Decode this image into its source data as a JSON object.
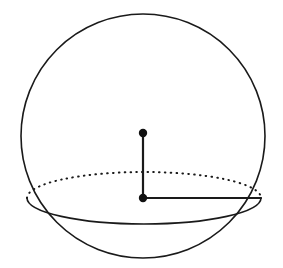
{
  "figure": {
    "background_color": "#ffffff",
    "stroke_color": "#1a1a1a",
    "dot_color": "#111111",
    "width": 283,
    "height": 268
  },
  "chart_data": {
    "type": "diagram",
    "subtype": "solid-geometry-sphere",
    "xlabel": "",
    "ylabel": "",
    "grid": false,
    "legend": false,
    "annotations": [],
    "shapes": [
      {
        "name": "sphere-outline",
        "kind": "circle",
        "cx": 143,
        "cy": 136,
        "r": 122,
        "style": "solid",
        "stroke_width": 1.6,
        "fill": "none"
      },
      {
        "name": "cross-section-back-arc",
        "kind": "ellipse-arc",
        "cx": 144,
        "cy": 198,
        "rx": 117,
        "ry": 26,
        "arc_half": "back-upper",
        "style": "dotted",
        "stroke_width": 2.0,
        "dash_pattern": "0.6 5.2"
      },
      {
        "name": "cross-section-front-arc",
        "kind": "ellipse-arc",
        "cx": 144,
        "cy": 198,
        "rx": 117,
        "ry": 26,
        "arc_half": "front-lower",
        "style": "solid",
        "stroke_width": 1.6
      },
      {
        "name": "vertical-axis-segment",
        "kind": "line",
        "x1": 143,
        "y1": 133,
        "x2": 143,
        "y2": 198,
        "style": "solid",
        "stroke_width": 2.2
      },
      {
        "name": "cross-section-radius-segment",
        "kind": "line",
        "x1": 143,
        "y1": 198,
        "x2": 261,
        "y2": 198,
        "style": "solid",
        "stroke_width": 2.2
      }
    ],
    "points": [
      {
        "name": "sphere-center-point",
        "x": 143,
        "y": 133,
        "radius": 4.2,
        "filled": true,
        "label": ""
      },
      {
        "name": "cross-section-center-point",
        "x": 143,
        "y": 198,
        "radius": 4.2,
        "filled": true,
        "label": ""
      }
    ]
  }
}
